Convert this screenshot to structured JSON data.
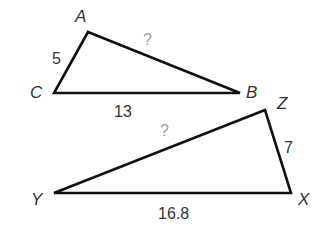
{
  "diagram": {
    "triangles": [
      {
        "name": "ABC",
        "vertices": {
          "A": [
            88,
            32
          ],
          "B": [
            240,
            93
          ],
          "C": [
            54,
            93
          ]
        },
        "vertex_labels": {
          "A": "A",
          "B": "B",
          "C": "C"
        },
        "sides": {
          "AC": "5",
          "CB": "13",
          "AB": "?"
        }
      },
      {
        "name": "XYZ",
        "vertices": {
          "X": [
            291,
            193
          ],
          "Y": [
            54,
            193
          ],
          "Z": [
            265,
            110
          ]
        },
        "vertex_labels": {
          "X": "X",
          "Y": "Y",
          "Z": "Z"
        },
        "sides": {
          "ZX": "7",
          "YX": "16.8",
          "YZ": "?"
        }
      }
    ],
    "colors": {
      "edge": "#111111",
      "label": "#333333",
      "unknown": "#9a9a9a",
      "background": "#ffffff"
    }
  }
}
